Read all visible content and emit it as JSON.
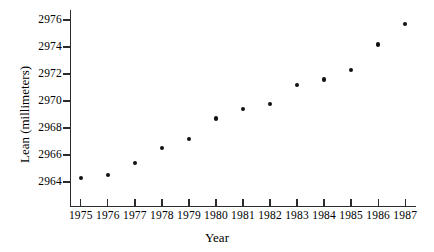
{
  "chart_data": {
    "type": "scatter",
    "title": "",
    "xlabel": "Year",
    "ylabel": "Lean (millimeters)",
    "x": [
      1975,
      1976,
      1977,
      1978,
      1979,
      1980,
      1981,
      1982,
      1983,
      1984,
      1985,
      1986,
      1987
    ],
    "values": [
      2964.3,
      2964.5,
      2965.4,
      2966.5,
      2967.2,
      2968.7,
      2969.4,
      2969.8,
      2971.2,
      2971.6,
      2972.3,
      2974.2,
      2975.7
    ],
    "xtick_labels": [
      "1975",
      "1976",
      "1977",
      "1978",
      "1979",
      "1980",
      "1981",
      "1982",
      "1983",
      "1984",
      "1985",
      "1986",
      "1987"
    ],
    "ytick_labels": [
      "2964",
      "2966",
      "2968",
      "2970",
      "2972",
      "2974",
      "2976"
    ],
    "yticks": [
      2964,
      2966,
      2968,
      2970,
      2972,
      2974,
      2976
    ],
    "xlim": [
      1974.6,
      1987.4
    ],
    "ylim": [
      2963.0,
      2976.8
    ],
    "grid": false,
    "legend": null,
    "marker_color": "#111111",
    "axis_color": "#2b2b2b"
  }
}
